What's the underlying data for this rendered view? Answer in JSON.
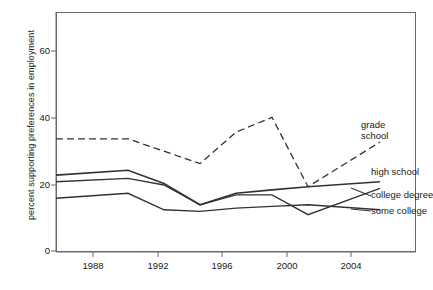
{
  "chart": {
    "type": "line",
    "ylabel": "percent supporting preferences in employment",
    "xlabel": "",
    "title": "",
    "grid": false,
    "legend_position": "right-inline-labels",
    "yticks": [
      0,
      20,
      40,
      60
    ],
    "ytick_labels": [
      "0",
      "20",
      "40",
      "60"
    ],
    "xticks": [
      1988,
      1992,
      1996,
      2000,
      2004
    ],
    "xtick_labels": [
      "1988",
      "1992",
      "1996",
      "2000",
      "2004"
    ],
    "xlim": [
      1986,
      2006
    ],
    "ylim": [
      0,
      72
    ],
    "line_color": "#333333",
    "frame_color": "#6b6b6b",
    "background": "#ffffff"
  },
  "chart_data": {
    "type": "line",
    "title": "",
    "xlabel": "",
    "ylabel": "percent supporting preferences in employment",
    "xlim": [
      1986,
      2006
    ],
    "ylim": [
      0,
      72
    ],
    "grid": false,
    "legend_position": "right-inline-labels",
    "x": [
      1986,
      1990,
      1992,
      1994,
      1996,
      1998,
      2000,
      2004
    ],
    "series": [
      {
        "name": "grade school",
        "style": "dashed",
        "x": [
          1986,
          1990,
          1994,
          1996,
          1998,
          2000,
          2004
        ],
        "values": [
          34,
          34,
          26.5,
          36,
          40.5,
          19.5,
          33
        ]
      },
      {
        "name": "high school",
        "style": "solid",
        "x": [
          1986,
          1990,
          1992,
          1994,
          1996,
          1998,
          2000,
          2004
        ],
        "values": [
          23,
          24.5,
          20.5,
          14,
          17.5,
          18.5,
          19.5,
          21
        ]
      },
      {
        "name": "college degree",
        "style": "solid",
        "x": [
          1986,
          1990,
          1992,
          1994,
          1996,
          1998,
          2000,
          2004
        ],
        "values": [
          21,
          22,
          20,
          14,
          17,
          17,
          11,
          19
        ]
      },
      {
        "name": "some college",
        "style": "solid",
        "x": [
          1986,
          1990,
          1992,
          1994,
          1996,
          1998,
          2000,
          2004
        ],
        "values": [
          16,
          17.5,
          12.5,
          12,
          13,
          13.5,
          14,
          12.5
        ]
      }
    ]
  },
  "labels": {
    "grade_school_line1": "grade",
    "grade_school_line2": "school",
    "high_school": "high school",
    "college_degree": "college degree",
    "some_college": "some college"
  }
}
